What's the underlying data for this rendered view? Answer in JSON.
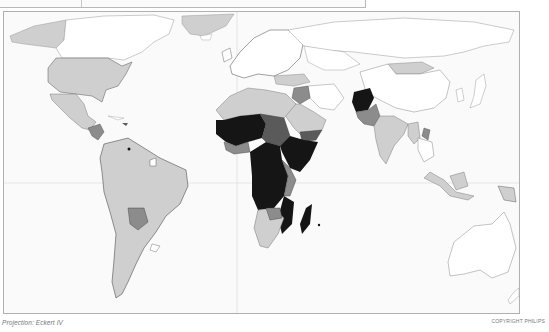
{
  "map": {
    "type": "choropleth-world-map",
    "projection_label": "Projection: Eckert IV",
    "copyright_label": "COPYRIGHT PHILIPS",
    "legend": null,
    "shade_classes": [
      {
        "name": "class-1-no-data-or-lowest",
        "color": "#ffffff"
      },
      {
        "name": "class-2-light",
        "color": "#cfcfcf"
      },
      {
        "name": "class-3-medium",
        "color": "#8c8c8c"
      },
      {
        "name": "class-4-dark",
        "color": "#5a5a5a"
      },
      {
        "name": "class-5-darkest",
        "color": "#151515"
      }
    ],
    "region_shading": {
      "north_america": {
        "usa": "class-2-light",
        "canada": "class-1-no-data-or-lowest",
        "mexico": "class-2-light",
        "greenland": "class-2-light",
        "alaska": "class-2-light"
      },
      "central_america": {
        "guatemala_honduras": "class-3-medium",
        "haiti": "class-4-dark"
      },
      "south_america": {
        "brazil": "class-2-light",
        "bolivia": "class-3-medium",
        "others": "class-2-light",
        "uruguay": "class-1-no-data-or-lowest",
        "french_guiana": "class-1-no-data-or-lowest"
      },
      "europe": {
        "all": "class-1-no-data-or-lowest"
      },
      "africa": {
        "sahel_central_east": "class-5-darkest",
        "west_central_partial": "class-4-dark",
        "north": "class-2-light",
        "south": "class-2-light",
        "madagascar": "class-5-darkest",
        "sudan": "class-3-medium"
      },
      "asia": {
        "afghanistan": "class-5-darkest",
        "pakistan": "class-3-medium",
        "india": "class-2-light",
        "mongolia": "class-2-light",
        "russia": "class-1-no-data-or-lowest",
        "china": "class-1-no-data-or-lowest",
        "middle_east": "class-2-light",
        "yemen": "class-4-dark",
        "laos": "class-3-medium",
        "indonesia": "class-2-light",
        "papua_new_guinea": "class-2-light"
      },
      "oceania": {
        "australia": "class-1-no-data-or-lowest",
        "new_zealand": "class-1-no-data-or-lowest"
      }
    },
    "graticule": {
      "equator_y": 182,
      "meridian_x": 236
    }
  }
}
